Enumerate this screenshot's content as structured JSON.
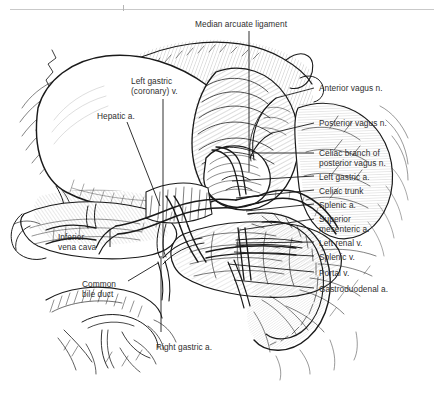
{
  "figure": {
    "kind": "anatomical-line-illustration",
    "background_color": "#ffffff",
    "ink_color": "#1a1a1a",
    "label_color": "#2f2f2f",
    "top_rule_color": "#c9c9c9"
  },
  "labels": [
    {
      "id": "median-arcuate-ligament",
      "text": "Median arcuate ligament",
      "x": 195,
      "y": 19,
      "align": "left",
      "leader": {
        "type": "vertical",
        "x1": 249,
        "y1": 31,
        "x2": 249,
        "y2": 172
      }
    },
    {
      "id": "left-gastric-coronary-v",
      "text": "Left gastric\n(coronary) v.",
      "x": 131,
      "y": 76,
      "align": "left",
      "leader": {
        "type": "vertical",
        "x1": 163,
        "y1": 99,
        "x2": 163,
        "y2": 258
      }
    },
    {
      "id": "hepatic-a",
      "text": "Hepatic a.",
      "x": 97,
      "y": 111,
      "align": "left",
      "leader": {
        "type": "diagonal",
        "x1": 127,
        "y1": 122,
        "x2": 160,
        "y2": 206
      }
    },
    {
      "id": "anterior-vagus-n",
      "text": "Anterior vagus n.",
      "x": 319,
      "y": 83,
      "align": "left",
      "leader": {
        "type": "horizontal",
        "x1": 306,
        "y1": 88,
        "x2": 276,
        "y2": 98
      }
    },
    {
      "id": "posterior-vagus-n",
      "text": "Posterior vagus n.",
      "x": 319,
      "y": 118,
      "align": "left",
      "leader": {
        "type": "horizontal",
        "x1": 306,
        "y1": 123,
        "x2": 272,
        "y2": 133
      }
    },
    {
      "id": "celiac-branch-of-posterior-vagus-n",
      "text": "Celiac branch of\nposterior vagus n.",
      "x": 319,
      "y": 148,
      "align": "left",
      "leader": {
        "type": "horizontal",
        "x1": 306,
        "y1": 153,
        "x2": 254,
        "y2": 153
      }
    },
    {
      "id": "left-gastric-a",
      "text": "Left gastric a.",
      "x": 319,
      "y": 172,
      "align": "left",
      "leader": {
        "type": "horizontal",
        "x1": 306,
        "y1": 176,
        "x2": 232,
        "y2": 180
      }
    },
    {
      "id": "celiac-trunk",
      "text": "Celiac trunk",
      "x": 319,
      "y": 186,
      "align": "left",
      "leader": {
        "type": "horizontal",
        "x1": 306,
        "y1": 190,
        "x2": 236,
        "y2": 197
      }
    },
    {
      "id": "splenic-a",
      "text": "Splenic a.",
      "x": 319,
      "y": 200,
      "align": "left",
      "leader": {
        "type": "horizontal",
        "x1": 306,
        "y1": 204,
        "x2": 244,
        "y2": 210
      }
    },
    {
      "id": "superior-mesenteric-a",
      "text": "Superior\nmesenteric a.",
      "x": 319,
      "y": 214,
      "align": "left",
      "leader": {
        "type": "horizontal",
        "x1": 306,
        "y1": 219,
        "x2": 238,
        "y2": 229
      }
    },
    {
      "id": "left-renal-v",
      "text": "Left renal v.",
      "x": 319,
      "y": 238,
      "align": "left",
      "leader": {
        "type": "horizontal",
        "x1": 306,
        "y1": 242,
        "x2": 236,
        "y2": 242
      }
    },
    {
      "id": "splenic-v",
      "text": "Splenic v.",
      "x": 319,
      "y": 252,
      "align": "left",
      "leader": {
        "type": "horizontal",
        "x1": 306,
        "y1": 256,
        "x2": 232,
        "y2": 252
      }
    },
    {
      "id": "portal-v",
      "text": "Portal v.",
      "x": 319,
      "y": 268,
      "align": "left",
      "leader": {
        "type": "horizontal",
        "x1": 306,
        "y1": 272,
        "x2": 226,
        "y2": 264
      }
    },
    {
      "id": "gastroduodenal-a",
      "text": "Gastroduodenal a.",
      "x": 319,
      "y": 284,
      "align": "left",
      "leader": {
        "type": "horizontal",
        "x1": 306,
        "y1": 288,
        "x2": 232,
        "y2": 280
      }
    },
    {
      "id": "inferior-vena-cava",
      "text": "Inferior\nvena cava",
      "x": 58,
      "y": 232,
      "align": "left",
      "leader": {
        "type": "vertical",
        "x1": 110,
        "y1": 231,
        "x2": 110,
        "y2": 246
      }
    },
    {
      "id": "common-bile-duct",
      "text": "Common\nbile duct",
      "x": 82,
      "y": 279,
      "align": "left",
      "leader": {
        "type": "diagonal",
        "x1": 128,
        "y1": 280,
        "x2": 158,
        "y2": 262
      }
    },
    {
      "id": "right-gastric-a",
      "text": "Right gastric a.",
      "x": 156,
      "y": 342,
      "align": "left",
      "leader": {
        "type": "vertical",
        "x1": 161,
        "y1": 330,
        "x2": 161,
        "y2": 255
      }
    }
  ]
}
